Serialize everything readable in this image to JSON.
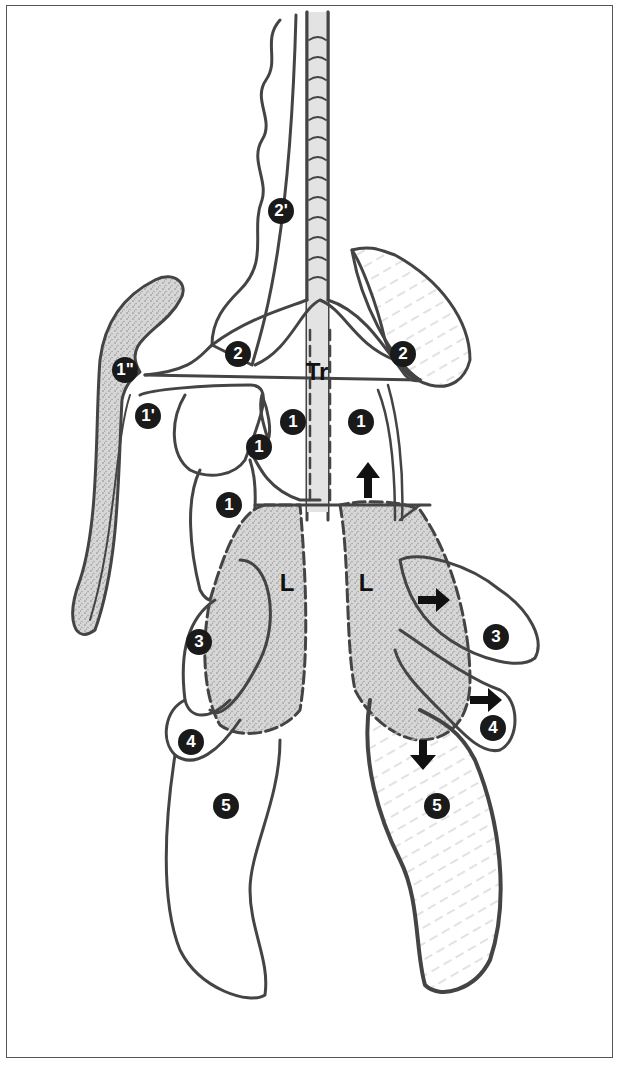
{
  "diagram": {
    "type": "anatomical-sketch",
    "labels": {
      "trachea": "Tr",
      "lung_left": "L",
      "lung_right": "L"
    },
    "badges": [
      {
        "id": "b-1pp",
        "text": "1\"",
        "x": 125,
        "y": 370
      },
      {
        "id": "b-1p",
        "text": "1'",
        "x": 148,
        "y": 416
      },
      {
        "id": "b-2p",
        "text": "2'",
        "x": 281,
        "y": 211
      },
      {
        "id": "b-2-left",
        "text": "2",
        "x": 238,
        "y": 354
      },
      {
        "id": "b-2-right",
        "text": "2",
        "x": 403,
        "y": 354
      },
      {
        "id": "b-1-a",
        "text": "1",
        "x": 293,
        "y": 422
      },
      {
        "id": "b-1-b",
        "text": "1",
        "x": 259,
        "y": 447
      },
      {
        "id": "b-1-c",
        "text": "1",
        "x": 361,
        "y": 422
      },
      {
        "id": "b-1-d",
        "text": "1",
        "x": 229,
        "y": 505
      },
      {
        "id": "b-3-left",
        "text": "3",
        "x": 199,
        "y": 642
      },
      {
        "id": "b-3-right",
        "text": "3",
        "x": 496,
        "y": 637
      },
      {
        "id": "b-4-left",
        "text": "4",
        "x": 191,
        "y": 742
      },
      {
        "id": "b-4-right",
        "text": "4",
        "x": 493,
        "y": 728
      },
      {
        "id": "b-5-left",
        "text": "5",
        "x": 226,
        "y": 806
      },
      {
        "id": "b-5-right",
        "text": "5",
        "x": 437,
        "y": 806
      }
    ],
    "arrows": [
      {
        "direction": "up",
        "x": 368,
        "y": 470
      },
      {
        "direction": "right",
        "x": 430,
        "y": 600
      },
      {
        "direction": "right",
        "x": 488,
        "y": 700
      },
      {
        "direction": "down",
        "x": 423,
        "y": 762
      }
    ],
    "colors": {
      "line": "#444444",
      "stipple": "#bdbdbd",
      "badge": "#1a1a1a",
      "background": "#ffffff"
    }
  }
}
